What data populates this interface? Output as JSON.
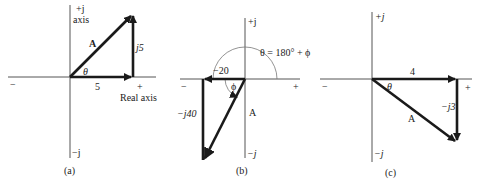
{
  "panels": [
    {
      "id": "a",
      "caption": "(a)",
      "labels": {
        "imag_pos": "+j",
        "imag_axis": "axis",
        "imag_neg": "−j",
        "real_neg": "−",
        "real_pos": "+",
        "real_axis": "Real axis",
        "vector": "A",
        "angle": "θ",
        "real_component": "5",
        "imag_component": "j5"
      }
    },
    {
      "id": "b",
      "caption": "(b)",
      "labels": {
        "imag_pos": "+j",
        "imag_neg": "−j",
        "real_neg": "−",
        "real_pos": "+",
        "vector": "A",
        "angle": "ϕ",
        "real_component": "−20",
        "imag_component": "−j40",
        "equation": "θ = 180° + ϕ"
      }
    },
    {
      "id": "c",
      "caption": "(c)",
      "labels": {
        "imag_pos": "+j",
        "imag_neg": "−j",
        "real_neg": "−",
        "real_pos": "+",
        "vector": "A",
        "angle": "θ",
        "real_component": "4",
        "imag_component": "−j3"
      }
    }
  ]
}
